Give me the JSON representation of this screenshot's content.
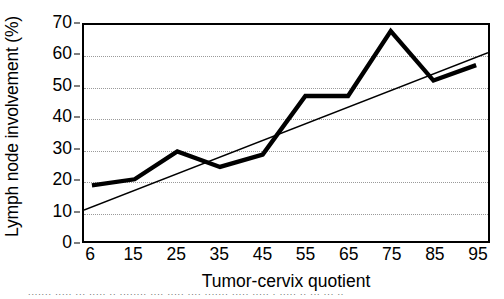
{
  "chart_data": {
    "type": "line",
    "title": "",
    "xlabel": "Tumor-cervix quotient",
    "ylabel": "Lymph node involvement (%)",
    "categories": [
      "6",
      "15",
      "25",
      "35",
      "45",
      "55",
      "65",
      "75",
      "85",
      "95"
    ],
    "x_tick_labels": [
      "6",
      "15",
      "25",
      "35",
      "45",
      "55",
      "65",
      "75",
      "85",
      "95"
    ],
    "y_tick_labels": [
      "0",
      "10",
      "20",
      "30",
      "40",
      "50",
      "60",
      "70"
    ],
    "y_ticks": [
      0,
      10,
      20,
      30,
      40,
      50,
      60,
      70
    ],
    "ylim": [
      0,
      70
    ],
    "grid": "horizontal-dotted",
    "legend": "none",
    "series": [
      {
        "name": "Lymph node involvement",
        "style": "thick-solid-black",
        "color": "#000000",
        "line_width": 4,
        "values": [
          18,
          20,
          29,
          24,
          28,
          47,
          47,
          68,
          52,
          57
        ]
      },
      {
        "name": "Linear trend",
        "style": "thin-solid-black",
        "color": "#000000",
        "line_width": 1.5,
        "endpoints": [
          10,
          61
        ],
        "values": [
          13.8,
          19.5,
          25.2,
          30.9,
          36.5,
          42.2,
          47.9,
          53.6,
          59.3,
          61
        ]
      }
    ]
  },
  "colors": {
    "axis": "#000000",
    "grid": "#9a9a9a",
    "background": "#ffffff",
    "data_line": "#000000",
    "trend_line": "#000000"
  },
  "caption": {
    "clipped_text": "figure caption clipped at page edge"
  }
}
